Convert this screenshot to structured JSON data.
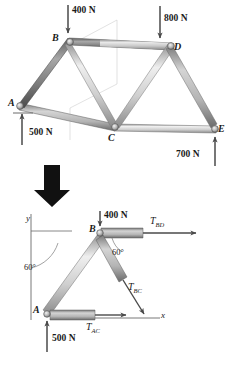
{
  "figure": {
    "type": "statics-truss-free-body-diagram",
    "panels": [
      {
        "name": "truss-assembly",
        "joints": [
          {
            "id": "A",
            "label": "A",
            "x": 18,
            "y": 104
          },
          {
            "id": "B",
            "label": "B",
            "x": 69,
            "y": 40
          },
          {
            "id": "C",
            "label": "C",
            "x": 114,
            "y": 128
          },
          {
            "id": "D",
            "label": "D",
            "x": 172,
            "y": 46
          },
          {
            "id": "E",
            "label": "E",
            "x": 216,
            "y": 129
          }
        ],
        "members": [
          "AB",
          "BD",
          "AC",
          "CE",
          "BC",
          "CD",
          "DE"
        ],
        "loads": [
          {
            "label": "400 N",
            "value": 400,
            "unit": "N",
            "at": "B",
            "direction": "down"
          },
          {
            "label": "800 N",
            "value": 800,
            "unit": "N",
            "at": "D",
            "direction": "down"
          }
        ],
        "reactions": [
          {
            "label": "500 N",
            "value": 500,
            "unit": "N",
            "at": "A",
            "direction": "up"
          },
          {
            "label": "700 N",
            "value": 700,
            "unit": "N",
            "at": "E",
            "direction": "up"
          }
        ]
      },
      {
        "name": "transition-arrow",
        "icon": "down-arrow-icon"
      },
      {
        "name": "free-body-diagram",
        "axes": {
          "x_label": "x",
          "y_label": "y"
        },
        "joints": [
          {
            "id": "B",
            "label": "B"
          },
          {
            "id": "A",
            "label": "A"
          }
        ],
        "loads": [
          {
            "label": "400 N",
            "value": 400,
            "unit": "N",
            "at": "B",
            "direction": "down"
          },
          {
            "label": "500 N",
            "value": 500,
            "unit": "N",
            "at": "A",
            "direction": "up"
          }
        ],
        "angles": [
          {
            "label": "60°",
            "value": 60,
            "unit": "deg",
            "between": "y-axis and BA"
          },
          {
            "label": "60°",
            "value": 60,
            "unit": "deg",
            "between": "BD and BC"
          }
        ],
        "member_forces": [
          {
            "name": "T_BD",
            "base": "T",
            "sub": "BD",
            "direction": "right"
          },
          {
            "name": "T_BC",
            "base": "T",
            "sub": "BC",
            "direction": "down-right"
          },
          {
            "name": "T_AC",
            "base": "T",
            "sub": "AC",
            "direction": "right"
          }
        ]
      }
    ],
    "colors": {
      "member_light": "#d9d9d9",
      "member_mid": "#b0b0b0",
      "member_dark": "#6e6e6e",
      "arrow": "#4a4a4a",
      "text": "#1a1a1a",
      "background": "#ffffff"
    }
  }
}
